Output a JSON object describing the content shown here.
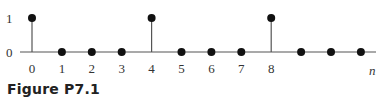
{
  "figure": {
    "caption": "Figure P7.1",
    "axis_label": "n",
    "y_ticks": [
      "1",
      "0"
    ],
    "x_ticks": [
      "0",
      "1",
      "2",
      "3",
      "4",
      "5",
      "6",
      "7",
      "8"
    ]
  },
  "chart_data": {
    "type": "stem",
    "title": "Figure P7.1",
    "xlabel": "n",
    "ylabel": "",
    "x": [
      0,
      1,
      2,
      3,
      4,
      5,
      6,
      7,
      8,
      9,
      10,
      11
    ],
    "values": [
      1,
      0,
      0,
      0,
      1,
      0,
      0,
      0,
      1,
      0,
      0,
      0
    ],
    "x_tick_labels": [
      "0",
      "1",
      "2",
      "3",
      "4",
      "5",
      "6",
      "7",
      "8"
    ],
    "y_tick_labels": [
      "0",
      "1"
    ],
    "ylim": [
      0,
      1
    ],
    "grid": false
  }
}
